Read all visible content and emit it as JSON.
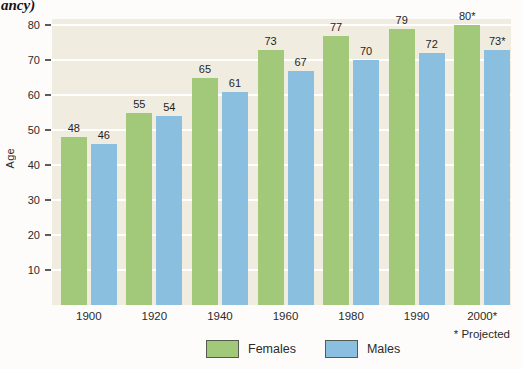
{
  "header": {
    "title_fragment": "ancy)"
  },
  "colors": {
    "plot_background": "#f0ecdf",
    "gridline": "#ffffff",
    "females_bar": "#a2c97a",
    "males_bar": "#8abfe0",
    "legend_border": "#565b50",
    "tick_mark": "#5c5c58",
    "text": "#2b2b2b"
  },
  "chart_data": {
    "type": "bar",
    "title": "",
    "categories": [
      "1900",
      "1920",
      "1940",
      "1960",
      "1980",
      "1990",
      "2000*"
    ],
    "series": [
      {
        "name": "Females",
        "color": "#a2c97a",
        "values": [
          48,
          55,
          65,
          73,
          77,
          79,
          80
        ],
        "bar_labels": [
          "48",
          "55",
          "65",
          "73",
          "77",
          "79",
          "80*"
        ]
      },
      {
        "name": "Males",
        "color": "#8abfe0",
        "values": [
          46,
          54,
          61,
          67,
          70,
          72,
          73
        ],
        "bar_labels": [
          "46",
          "54",
          "61",
          "67",
          "70",
          "72",
          "73*"
        ]
      }
    ],
    "xlabel": "",
    "ylabel": "Age",
    "ylim": [
      0,
      82
    ],
    "yticks": [
      10,
      20,
      30,
      40,
      50,
      60,
      70,
      80
    ],
    "grid": true,
    "legend_position": "bottom",
    "footnote": "* Projected"
  }
}
